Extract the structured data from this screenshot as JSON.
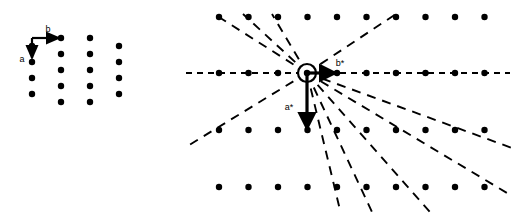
{
  "figure": {
    "background_color": "#ffffff",
    "dot_color": "#000000",
    "line_color": "#000000",
    "dot_radius": 3.2,
    "width": 517,
    "height": 222
  },
  "direct_lattice": {
    "name": "direct-lattice",
    "origin": {
      "x": 32,
      "y": 46
    },
    "column_spacing": 29,
    "row_spacing": 16,
    "column_offset_y": -8,
    "columns": [
      {
        "x": 32,
        "rows": [
          46,
          62,
          78,
          94
        ]
      },
      {
        "x": 61,
        "rows": [
          38,
          54,
          70,
          86,
          102
        ]
      },
      {
        "x": 90,
        "rows": [
          38,
          54,
          70,
          86,
          102
        ]
      },
      {
        "x": 119,
        "rows": [
          46,
          62,
          78,
          94
        ]
      }
    ],
    "vectors": [
      {
        "name": "vector-a",
        "label": "a",
        "label_x": 22,
        "label_y": 62,
        "x1": 32,
        "y1": 38,
        "x2": 32,
        "y2": 58
      },
      {
        "name": "vector-b",
        "label": "b",
        "label_x": 48,
        "label_y": 32,
        "x1": 32,
        "y1": 38,
        "x2": 59,
        "y2": 38
      }
    ]
  },
  "reciprocal_lattice": {
    "name": "reciprocal-lattice",
    "origin": {
      "x": 307,
      "y": 73
    },
    "origin_circle_radius": 9,
    "column_spacing": 29.5,
    "row_spacing": 57,
    "first_column_x": 219,
    "rows_y": [
      17,
      73,
      130,
      187
    ],
    "columns_count": 10,
    "vectors": [
      {
        "name": "vector-a-star",
        "label": "a*",
        "label_x": 289,
        "label_y": 110,
        "x1": 307,
        "y1": 73,
        "x2": 307,
        "y2": 128
      },
      {
        "name": "vector-b-star",
        "label": "b*",
        "label_x": 340,
        "label_y": 66,
        "x1": 307,
        "y1": 73,
        "x2": 335,
        "y2": 73
      }
    ],
    "zone_lines": [
      {
        "name": "zone-line-horizontal",
        "x1": 186,
        "y1": 73,
        "x2": 510,
        "y2": 73,
        "dash": "6,5"
      },
      {
        "name": "zone-line-upleft-1",
        "x1": 307,
        "y1": 73,
        "x2": 214,
        "y2": 14,
        "dash": "9,7"
      },
      {
        "name": "zone-line-upleft-2",
        "x1": 307,
        "y1": 73,
        "x2": 243,
        "y2": 14,
        "dash": "9,7"
      },
      {
        "name": "zone-line-upleft-3",
        "x1": 307,
        "y1": 73,
        "x2": 272,
        "y2": 14,
        "dash": "9,7"
      },
      {
        "name": "zone-line-upright-1",
        "x1": 307,
        "y1": 73,
        "x2": 396,
        "y2": 14,
        "dash": "9,7"
      },
      {
        "name": "zone-line-downleft-1",
        "x1": 307,
        "y1": 73,
        "x2": 186,
        "y2": 147,
        "dash": "9,7"
      },
      {
        "name": "zone-line-downright-1",
        "x1": 307,
        "y1": 73,
        "x2": 340,
        "y2": 210,
        "dash": "9,7"
      },
      {
        "name": "zone-line-downright-2",
        "x1": 307,
        "y1": 73,
        "x2": 372,
        "y2": 212,
        "dash": "9,7"
      },
      {
        "name": "zone-line-downright-3",
        "x1": 307,
        "y1": 73,
        "x2": 430,
        "y2": 212,
        "dash": "9,7"
      },
      {
        "name": "zone-line-downright-4",
        "x1": 307,
        "y1": 73,
        "x2": 512,
        "y2": 196,
        "dash": "9,7"
      },
      {
        "name": "zone-line-downright-5",
        "x1": 307,
        "y1": 73,
        "x2": 512,
        "y2": 148,
        "dash": "9,7"
      }
    ]
  }
}
